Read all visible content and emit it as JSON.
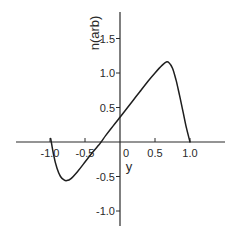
{
  "chart_data": {
    "type": "line",
    "title": "",
    "xlabel": "y",
    "ylabel": "n(arb)",
    "xlim": [
      -1.5,
      1.5
    ],
    "ylim": [
      -1.2,
      1.9
    ],
    "grid": false,
    "legend": null,
    "x_ticks": [
      -1.0,
      -0.5,
      0,
      0.5,
      1.0
    ],
    "x_tick_labels": [
      "-1.0",
      "-0.5",
      "0",
      "0.5",
      "1.0"
    ],
    "y_ticks": [
      -1.0,
      -0.5,
      0.5,
      1.0,
      1.5
    ],
    "y_tick_labels": [
      "-1.0",
      "-0.5",
      "0.5",
      "1.0",
      "1.5"
    ],
    "series": [
      {
        "name": "n(y)",
        "x": [
          -0.99,
          -0.95,
          -0.9,
          -0.85,
          -0.8,
          -0.76,
          -0.7,
          -0.6,
          -0.5,
          -0.4,
          -0.3,
          -0.27,
          -0.2,
          -0.1,
          0.0,
          0.1,
          0.2,
          0.3,
          0.4,
          0.5,
          0.6,
          0.66,
          0.7,
          0.75,
          0.8,
          0.85,
          0.9,
          0.95,
          1.0
        ],
        "values": [
          0.05,
          -0.18,
          -0.38,
          -0.5,
          -0.55,
          -0.56,
          -0.53,
          -0.42,
          -0.29,
          -0.16,
          -0.04,
          0.0,
          0.1,
          0.23,
          0.36,
          0.49,
          0.62,
          0.75,
          0.88,
          1.0,
          1.11,
          1.16,
          1.15,
          1.07,
          0.9,
          0.68,
          0.44,
          0.2,
          0.0
        ]
      }
    ]
  }
}
